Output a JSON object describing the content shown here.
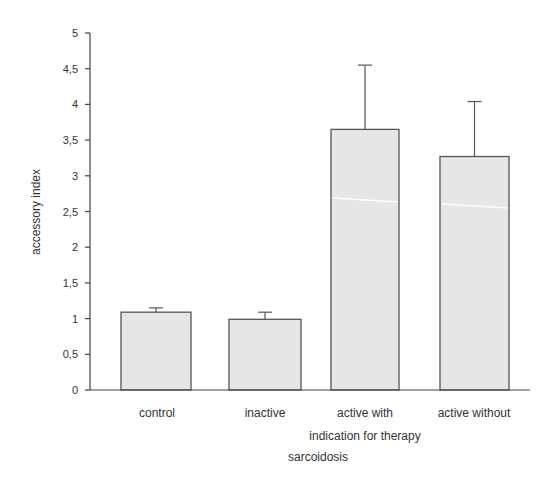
{
  "chart_data": {
    "type": "bar",
    "title": "",
    "xlabel": "sarcoidosis",
    "ylabel": "accessory index",
    "categories": [
      "control",
      "inactive",
      "active with",
      "active without"
    ],
    "category_group_label": "indication for therapy",
    "values": [
      1.09,
      0.99,
      3.65,
      3.27
    ],
    "error_upper": [
      1.15,
      1.09,
      4.55,
      4.04
    ],
    "error_bars": [
      0.06,
      0.1,
      0.9,
      0.77
    ],
    "ylim": [
      0,
      5
    ],
    "yticks": [
      0,
      0.5,
      1,
      1.5,
      2,
      2.5,
      3,
      3.5,
      4,
      4.5,
      5
    ],
    "ytick_labels": [
      "0",
      "0,5",
      "1",
      "1,5",
      "2",
      "2,5",
      "3",
      "3,5",
      "4",
      "4,5",
      "5"
    ],
    "grid": false,
    "legend": null,
    "bar_color": "#e6e6e6",
    "edge_color": "#555555"
  }
}
